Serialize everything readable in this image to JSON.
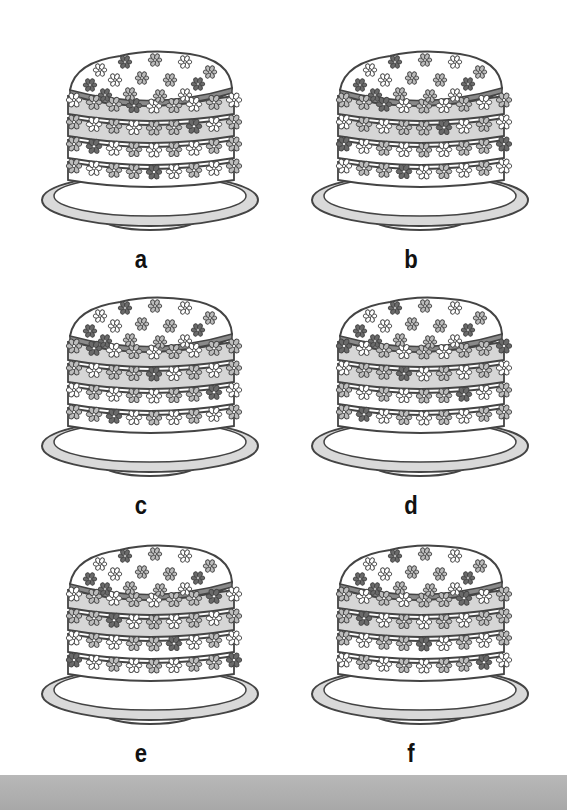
{
  "panels": [
    {
      "id": "a",
      "label": "a",
      "x": 30,
      "y": 40
    },
    {
      "id": "b",
      "label": "b",
      "x": 300,
      "y": 40
    },
    {
      "id": "c",
      "label": "c",
      "x": 30,
      "y": 286
    },
    {
      "id": "d",
      "label": "d",
      "x": 300,
      "y": 286
    },
    {
      "id": "e",
      "label": "e",
      "x": 30,
      "y": 534
    },
    {
      "id": "f",
      "label": "f",
      "x": 300,
      "y": 534
    }
  ],
  "colors": {
    "outline": "#444444",
    "layer_fill": "#d6d6d6",
    "cream_fill": "#ffffff",
    "flower_dark": "#6a6a6a",
    "flower_mid": "#bdbdbd",
    "flower_light": "#ffffff",
    "plate": "#d9d9d9",
    "bottom_band": "#b0b0b0"
  }
}
